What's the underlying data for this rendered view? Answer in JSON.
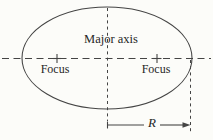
{
  "diagram": {
    "labels": {
      "major_axis": "Major axis",
      "left_focus": "Focus",
      "right_focus": "Focus",
      "radius": "R"
    },
    "colors": {
      "background": "#fcfcf9",
      "line": "#444444",
      "text": "#262626"
    }
  }
}
